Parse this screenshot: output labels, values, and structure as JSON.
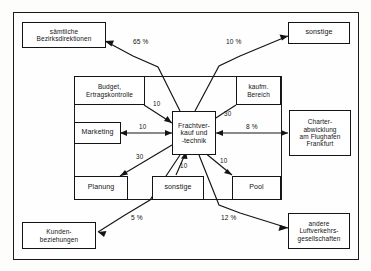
{
  "diagram": {
    "frame": {
      "border_color": "#1a1a1a"
    },
    "center": {
      "id": "frachtverkauf",
      "lines": [
        "Frachtver-",
        "kauf und",
        "-technik"
      ]
    },
    "inner_group": {
      "label": "",
      "nodes": [
        {
          "id": "budget",
          "lines": [
            "Budget,",
            "Ertragskontrolle"
          ]
        },
        {
          "id": "kaufm",
          "lines": [
            "kaufm.",
            "Bereich"
          ]
        },
        {
          "id": "marketing",
          "lines": [
            "Marketing"
          ]
        },
        {
          "id": "planung",
          "lines": [
            "Planung"
          ]
        },
        {
          "id": "sonstige_inner",
          "lines": [
            "sonstige"
          ]
        },
        {
          "id": "pool",
          "lines": [
            "Pool"
          ]
        }
      ]
    },
    "outer_nodes": [
      {
        "id": "bezirksdirektionen",
        "lines": [
          "sämtliche",
          "Bezirksdirektionen"
        ]
      },
      {
        "id": "sonstige_top",
        "lines": [
          "sonstige"
        ]
      },
      {
        "id": "charter",
        "lines": [
          "Charter-",
          "abwicklung",
          "am Flughafen",
          "Frankfurt"
        ]
      },
      {
        "id": "luftverkehr",
        "lines": [
          "andere",
          "Luftverkehrs-",
          "gesellschaften"
        ]
      },
      {
        "id": "kundenbeziehungen",
        "lines": [
          "Kunden-",
          "beziehungen"
        ]
      }
    ],
    "edge_labels": {
      "bezirksdirektionen": "65 %",
      "sonstige_top": "10 %",
      "charter": "8 %",
      "luftverkehr": "12 %",
      "kundenbeziehungen": "5 %",
      "budget": "10",
      "kaufm": "30",
      "marketing": "10",
      "planung": "30",
      "sonstige_inner": "10",
      "pool": "10"
    }
  }
}
